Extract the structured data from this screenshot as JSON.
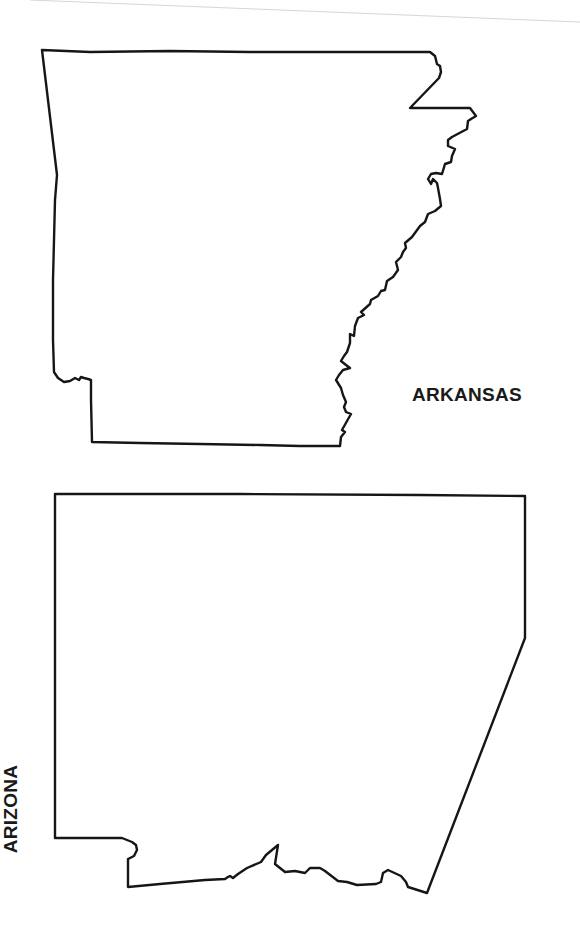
{
  "page": {
    "background": "#ffffff",
    "ink_color": "#161616"
  },
  "states": [
    {
      "id": "arkansas",
      "label": "ARKANSAS",
      "label_orientation": "horizontal"
    },
    {
      "id": "arizona",
      "label": "ARIZONA",
      "label_orientation": "rotated-90-ccw"
    }
  ]
}
